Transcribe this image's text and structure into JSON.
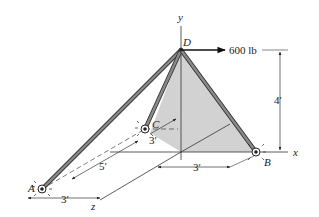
{
  "figure": {
    "points": {
      "A": "A",
      "B": "B",
      "C": "C",
      "D": "D"
    },
    "axes": {
      "x": "x",
      "y": "y",
      "z": "z"
    },
    "load": {
      "label": "600 lb",
      "direction": "positive x",
      "at": "D"
    },
    "dimensions": {
      "height_D": "4′",
      "C_offset_x": "3′",
      "C_to_A_z": "5′",
      "A_offset_x": "3′",
      "B_offset_x": "3′"
    },
    "colors": {
      "member": "#6b6b6b",
      "member_edge": "#333333",
      "plane_fill": "#d2d2d2",
      "line": "#333333"
    }
  }
}
